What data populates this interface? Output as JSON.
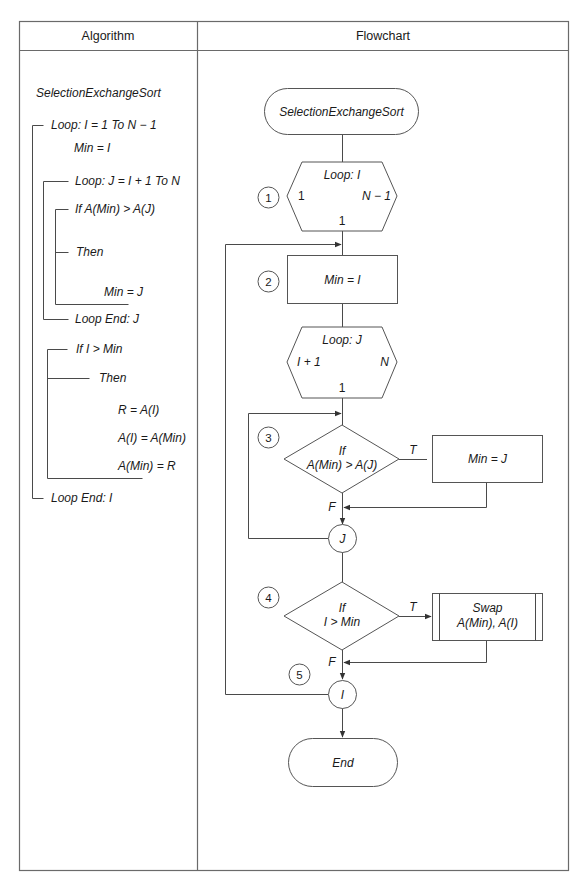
{
  "table": {
    "headers": {
      "algorithm": "Algorithm",
      "flowchart": "Flowchart"
    }
  },
  "algorithm": {
    "title": "SelectionExchangeSort",
    "lines": [
      "Loop: I = 1 To N − 1",
      "Min = I",
      "Loop: J = I + 1 To N",
      "If A(Min) > A(J)",
      "Then",
      "Min = J",
      "Loop End: J",
      "If I > Min",
      "Then",
      "R = A(I)",
      "A(I) = A(Min)",
      "A(Min) = R",
      "Loop End: I"
    ]
  },
  "flowchart": {
    "start": "SelectionExchangeSort",
    "loop_i": {
      "label": "Loop: I",
      "from": "1",
      "to": "N − 1",
      "step": "1"
    },
    "min_eq_i": "Min = I",
    "loop_j": {
      "label": "Loop: J",
      "from": "I + 1",
      "to": "N",
      "step": "1"
    },
    "decision1": {
      "line1": "If",
      "line2": "A(Min) > A(J)",
      "true_label": "T",
      "false_label": "F"
    },
    "min_eq_j": "Min = J",
    "connector_j": "J",
    "decision2": {
      "line1": "If",
      "line2": "I > Min",
      "true_label": "T",
      "false_label": "F"
    },
    "swap": {
      "line1": "Swap",
      "line2": "A(Min), A(I)"
    },
    "connector_i": "I",
    "end": "End",
    "step_markers": [
      "1",
      "2",
      "3",
      "4",
      "5"
    ]
  }
}
